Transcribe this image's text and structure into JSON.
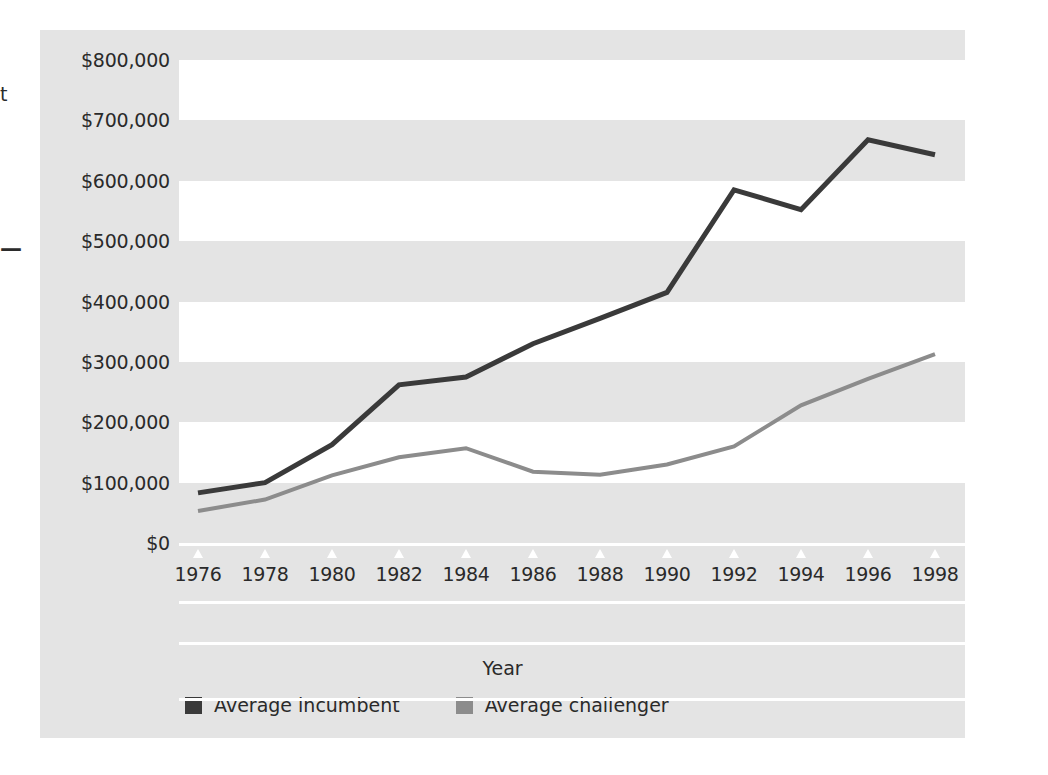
{
  "page": {
    "artifacts": [
      {
        "name": "cropped-letter-fragment",
        "text": "t"
      },
      {
        "name": "cropped-dash-fragment",
        "text": "—"
      }
    ]
  },
  "chart_data": {
    "type": "line",
    "title": "",
    "subtitle": "",
    "xlabel": "Year",
    "ylabel": "",
    "x": [
      1976,
      1978,
      1980,
      1982,
      1984,
      1986,
      1988,
      1990,
      1992,
      1994,
      1996,
      1998
    ],
    "categories": [
      "1976",
      "1978",
      "1980",
      "1982",
      "1984",
      "1986",
      "1988",
      "1990",
      "1992",
      "1994",
      "1996",
      "1998"
    ],
    "xlim": [
      1976,
      1998
    ],
    "ylim": [
      0,
      800000
    ],
    "ytick_values": [
      0,
      100000,
      200000,
      300000,
      400000,
      500000,
      600000,
      700000,
      800000
    ],
    "ytick_labels": [
      "$0",
      "$100,000",
      "$200,000",
      "$300,000",
      "$400,000",
      "$500,000",
      "$600,000",
      "$700,000",
      "$800,000"
    ],
    "grid": "horizontal-alternating-bands",
    "legend_position": "bottom-left",
    "series": [
      {
        "name": "Average incumbent",
        "color": "#3a3a3a",
        "values": [
          83000,
          100000,
          163000,
          262000,
          275000,
          330000,
          372000,
          415000,
          585000,
          552000,
          668000,
          643000
        ]
      },
      {
        "name": "Average challenger",
        "color": "#8c8c8c",
        "values": [
          53000,
          72000,
          112000,
          142000,
          157000,
          118000,
          113000,
          130000,
          160000,
          228000,
          272000,
          313000
        ]
      }
    ]
  },
  "colors": {
    "panel_background": "#e4e4e4",
    "band_white": "#ffffff",
    "text": "#2a2a2a",
    "incumbent": "#3a3a3a",
    "challenger": "#8c8c8c"
  }
}
